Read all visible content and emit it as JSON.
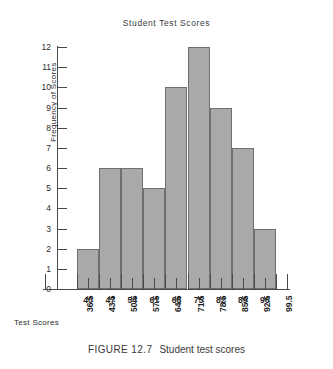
{
  "chart_data": {
    "type": "bar",
    "title": "Student Test Scores",
    "xlabel": "Test Scores",
    "ylabel": "Frequency of Scores",
    "categories": [
      "40",
      "47",
      "54",
      "61",
      "68",
      "75",
      "82",
      "89",
      "96"
    ],
    "values": [
      2,
      6,
      6,
      5,
      10,
      12,
      9,
      7,
      3
    ],
    "bin_boundaries": [
      "36.5",
      "43.5",
      "50.5",
      "57.5",
      "64.5",
      "71.5",
      "78.5",
      "85.5",
      "92.5",
      "99.5"
    ],
    "ylim": [
      0,
      12
    ],
    "yticks": [
      "0",
      "1",
      "2",
      "3",
      "4",
      "5",
      "6",
      "7",
      "8",
      "9",
      "10",
      "11",
      "12"
    ],
    "grid": false,
    "legend": false,
    "bar_color": "#a9a9a9",
    "bar_edge_color": "#6f6f6f",
    "axis_color": "#4a4a4a"
  },
  "caption": {
    "number": "FIGURE 12.7",
    "text": "Student test scores"
  }
}
